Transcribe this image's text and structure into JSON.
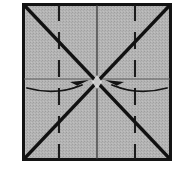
{
  "diagram": {
    "title": "Origami square fold step",
    "type": "origami-fold-instruction",
    "canvas": {
      "width": 189,
      "height": 184,
      "background": "#ffffff"
    },
    "paper": {
      "name": "square-paper-sheet",
      "shape": "square",
      "x": 22,
      "y": 3,
      "width": 150,
      "height": 158,
      "fill_color": "#b2b2b2",
      "texture": "halftone-stipple",
      "border_color": "#141414",
      "border_width": 3
    },
    "fold_lines": [
      {
        "name": "diagonal-fold-top-left-to-bottom-right",
        "style": "solid",
        "color": "#111111",
        "width": 3.4,
        "x1": 24,
        "y1": 5,
        "x2": 170,
        "y2": 159
      },
      {
        "name": "diagonal-fold-bottom-left-to-top-right",
        "style": "solid",
        "color": "#111111",
        "width": 3.4,
        "x1": 24,
        "y1": 159,
        "x2": 170,
        "y2": 5
      },
      {
        "name": "vertical-center-line",
        "style": "solid",
        "color": "#3a3a3a",
        "width": 1.3,
        "x1": 97,
        "y1": 5,
        "x2": 97,
        "y2": 159
      },
      {
        "name": "horizontal-center-line",
        "style": "solid",
        "color": "#5d5d5d",
        "width": 1.0,
        "x1": 24,
        "y1": 79,
        "x2": 170,
        "y2": 79
      },
      {
        "name": "vertical-crease-left-quarter",
        "style": "dashed",
        "color": "#1c1c1c",
        "width": 2.1,
        "dash": "17 11",
        "x1": 59,
        "y1": 4,
        "x2": 59,
        "y2": 160
      },
      {
        "name": "vertical-crease-right-quarter",
        "style": "dashed",
        "color": "#1c1c1c",
        "width": 2.1,
        "dash": "17 11",
        "x1": 135,
        "y1": 4,
        "x2": 135,
        "y2": 160
      }
    ],
    "arrows": [
      {
        "name": "fold-arrow-left-to-center",
        "direction": "right",
        "meaning": "fold left edge in toward center",
        "color": "#141414",
        "stroke_width": 1.8,
        "path": "M 27 88 Q 56 96 84 84",
        "head_points": "88 81 72 83 79 87 70 90",
        "start_x": 27,
        "start_y": 88,
        "end_x": 88,
        "end_y": 81
      },
      {
        "name": "fold-arrow-right-to-center",
        "direction": "left",
        "meaning": "fold right edge in toward center",
        "color": "#141414",
        "stroke_width": 1.8,
        "path": "M 167 88 Q 138 96 110 84",
        "head_points": "106 81 122 83 115 87 124 90",
        "start_x": 167,
        "start_y": 88,
        "end_x": 106,
        "end_y": 81
      }
    ],
    "crossing_point": {
      "name": "fold-intersection-center",
      "x": 97,
      "y": 82
    }
  }
}
